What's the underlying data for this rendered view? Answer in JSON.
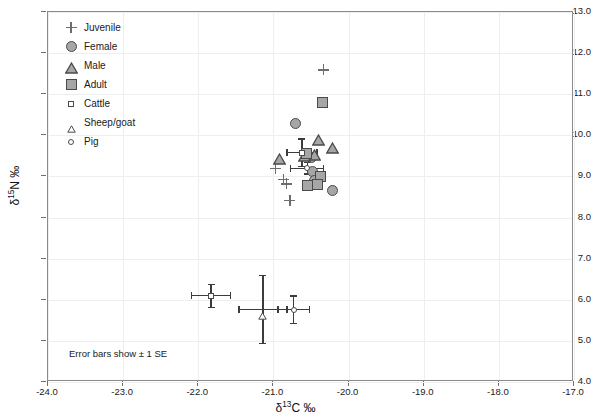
{
  "axes": {
    "x": {
      "label": "δ13C ‰",
      "label_base": "δ",
      "label_sup": "13",
      "label_tail": "C ‰",
      "min": -24.0,
      "max": -17.0,
      "step": 1.0,
      "ticks": [
        "-24.0",
        "-23.0",
        "-22.0",
        "-21.0",
        "-20.0",
        "-19.0",
        "-18.0",
        "-17.0"
      ]
    },
    "y": {
      "label": "δ15N ‰",
      "label_base": "δ",
      "label_sup": "15",
      "label_tail": "N ‰",
      "min": 4.0,
      "max": 13.0,
      "step": 1.0,
      "ticks": [
        "13.0",
        "12.0",
        "11.0",
        "10.0",
        "9.0",
        "8.0",
        "7.0",
        "6.0",
        "5.0",
        "4.0"
      ]
    }
  },
  "legend": {
    "items": [
      {
        "label": "Juvenile",
        "glyph": "plus",
        "name": "legend-marker-juvenile"
      },
      {
        "label": "Female",
        "glyph": "circle",
        "name": "legend-marker-female"
      },
      {
        "label": "Male",
        "glyph": "triangle",
        "name": "legend-marker-male"
      },
      {
        "label": "Adult",
        "glyph": "square",
        "name": "legend-marker-adult"
      },
      {
        "label": "Cattle",
        "glyph": "square-sm",
        "name": "legend-marker-cattle"
      },
      {
        "label": "Sheep/goat",
        "glyph": "triangle-sm",
        "name": "legend-marker-sheepgoat"
      },
      {
        "label": "Pig",
        "glyph": "circle-sm",
        "name": "legend-marker-pig"
      }
    ]
  },
  "caption": "Error bars show ± 1 SE",
  "colors": {
    "marker_fill": "#a6a6a6",
    "marker_stroke": "#4a4a4a",
    "error_bar": "#3c3c3c",
    "grid": "#eceef1",
    "frame": "#8a8a8a"
  },
  "chart_data": {
    "type": "scatter",
    "title": "",
    "xlabel": "δ13C ‰",
    "ylabel": "δ15N ‰",
    "xlim": [
      -24.0,
      -17.0
    ],
    "ylim": [
      4.0,
      13.0
    ],
    "grid": true,
    "legend_position": "top-left-inside",
    "error_bars": "± 1 SE",
    "series": [
      {
        "name": "Juvenile",
        "marker": "plus",
        "points": [
          {
            "x": -20.33,
            "y": 11.59
          },
          {
            "x": -20.97,
            "y": 9.2
          },
          {
            "x": -20.87,
            "y": 8.92
          },
          {
            "x": -20.83,
            "y": 8.82
          },
          {
            "x": -20.78,
            "y": 8.41
          }
        ]
      },
      {
        "name": "Female",
        "marker": "circle",
        "points": [
          {
            "x": -20.71,
            "y": 10.3
          },
          {
            "x": -20.49,
            "y": 9.45
          },
          {
            "x": -20.48,
            "y": 9.12
          },
          {
            "x": -20.45,
            "y": 8.9
          },
          {
            "x": -20.22,
            "y": 8.65
          }
        ]
      },
      {
        "name": "Male",
        "marker": "triangle",
        "points": [
          {
            "x": -20.4,
            "y": 9.93
          },
          {
            "x": -20.21,
            "y": 9.74
          },
          {
            "x": -20.45,
            "y": 9.58
          },
          {
            "x": -20.58,
            "y": 9.55
          },
          {
            "x": -20.92,
            "y": 9.48
          }
        ]
      },
      {
        "name": "Adult",
        "marker": "square",
        "points": [
          {
            "x": -20.35,
            "y": 10.79
          },
          {
            "x": -20.56,
            "y": 9.55
          },
          {
            "x": -20.38,
            "y": 9.0
          },
          {
            "x": -20.41,
            "y": 8.8
          },
          {
            "x": -20.54,
            "y": 8.78
          }
        ]
      },
      {
        "name": "Cattle",
        "marker": "square-sm",
        "mean": {
          "x": -21.83,
          "y": 6.1
        },
        "error": {
          "x_se": 0.26,
          "y_se": 0.28
        }
      },
      {
        "name": "Sheep/goat",
        "marker": "triangle-sm",
        "mean": {
          "x": -21.14,
          "y": 5.76
        },
        "error": {
          "x_se": 0.32,
          "y_se": 0.83
        }
      },
      {
        "name": "Pig",
        "marker": "circle-sm",
        "mean": {
          "x": -20.73,
          "y": 5.76
        },
        "error": {
          "x_se": 0.21,
          "y_se": 0.33
        }
      },
      {
        "name": "Cluster means (upper)",
        "marker": "mixed",
        "means": [
          {
            "label": "cattle-upper",
            "x": -20.62,
            "y": 9.58,
            "x_se": 0.2,
            "y_se": 0.33
          },
          {
            "label": "pig-upper",
            "x": -20.55,
            "y": 9.2,
            "x_se": 0.22,
            "y_se": 0.14
          }
        ]
      }
    ]
  }
}
